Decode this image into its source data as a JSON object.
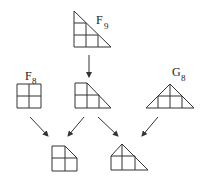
{
  "diagram": {
    "labels": {
      "f9": {
        "main": "F",
        "sub": "9"
      },
      "f8": {
        "main": "F",
        "sub": "8"
      },
      "g8": {
        "main": "G",
        "sub": "8"
      }
    },
    "nodes": [
      {
        "id": "F9",
        "shape": "right-triangle-3x3-grid",
        "label": "F9"
      },
      {
        "id": "F8",
        "shape": "square-2x2-grid",
        "label": "F8"
      },
      {
        "id": "mid",
        "shape": "trapezoid-grid",
        "label": ""
      },
      {
        "id": "G8",
        "shape": "isosceles-triangle-grid",
        "label": "G8"
      },
      {
        "id": "bottom-left",
        "shape": "square-cut-corner-2x2",
        "label": ""
      },
      {
        "id": "bottom-right",
        "shape": "house-triangle-grid",
        "label": ""
      }
    ],
    "edges": [
      {
        "from": "F9",
        "to": "mid"
      },
      {
        "from": "F8",
        "to": "bottom-left"
      },
      {
        "from": "mid",
        "to": "bottom-left"
      },
      {
        "from": "mid",
        "to": "bottom-right"
      },
      {
        "from": "G8",
        "to": "bottom-right"
      }
    ],
    "colors": {
      "stroke": "#333333",
      "background": "#ffffff"
    }
  }
}
